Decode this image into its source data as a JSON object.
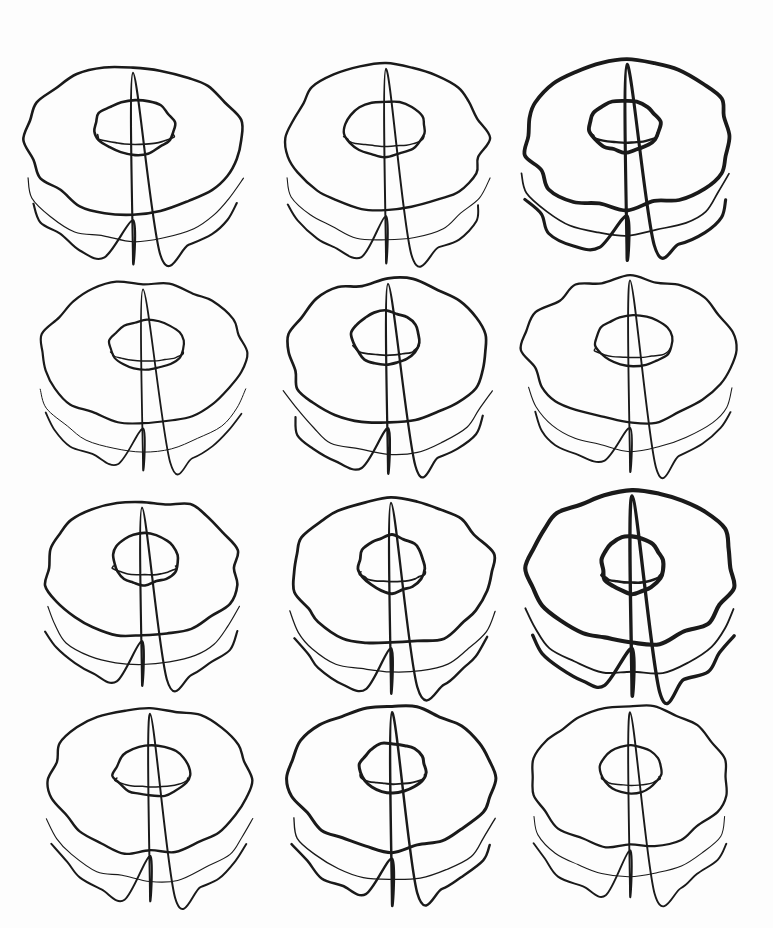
{
  "artwork": {
    "title": "Twelve hand-drawn donuts",
    "description": "Grid of twelve hand-drawn line-art doughnut (torus) shapes in four rows of three, black ink contour on white ground",
    "medium": "ink line drawing",
    "background_color": "#fdfdfd",
    "ink_color": "#1a1a1a",
    "canvas": {
      "width": 773,
      "height": 928
    },
    "grid": {
      "rows": 4,
      "columns": 3,
      "count": 12
    }
  },
  "chart_data": {
    "type": "scatter",
    "xlabel": "",
    "ylabel": "",
    "grid": false,
    "legend": "none",
    "xlim": [
      0,
      773
    ],
    "ylim": [
      0,
      928
    ],
    "columns": [
      "id",
      "row",
      "col",
      "cx",
      "cy",
      "rx",
      "ry",
      "hole_rx",
      "hole_ry",
      "hole_offset_x",
      "hole_offset_y",
      "thickness",
      "stroke_width",
      "wobble"
    ],
    "donuts": [
      {
        "id": "r1c1",
        "row": 1,
        "col": 1,
        "cx": 133,
        "cy": 140,
        "rx": 108,
        "ry": 74,
        "hole_rx": 40,
        "hole_ry": 27,
        "hole_offset_x": 2,
        "hole_offset_y": -13,
        "thickness": 44,
        "stroke_width": 2.6,
        "wobble": 0.055,
        "seed": 11
      },
      {
        "id": "r1c2",
        "row": 1,
        "col": 2,
        "cx": 386,
        "cy": 138,
        "rx": 100,
        "ry": 72,
        "hole_rx": 41,
        "hole_ry": 27,
        "hole_offset_x": -1,
        "hole_offset_y": -9,
        "thickness": 48,
        "stroke_width": 2.4,
        "wobble": 0.06,
        "seed": 23
      },
      {
        "id": "r1c3",
        "row": 1,
        "col": 3,
        "cx": 627,
        "cy": 136,
        "rx": 104,
        "ry": 72,
        "hole_rx": 35,
        "hole_ry": 26,
        "hole_offset_x": -2,
        "hole_offset_y": -10,
        "thickness": 44,
        "stroke_width": 3.8,
        "wobble": 0.07,
        "seed": 37
      },
      {
        "id": "r2c1",
        "row": 2,
        "col": 1,
        "cx": 143,
        "cy": 353,
        "rx": 101,
        "ry": 71,
        "hole_rx": 37,
        "hole_ry": 25,
        "hole_offset_x": 4,
        "hole_offset_y": -8,
        "thickness": 42,
        "stroke_width": 2.2,
        "wobble": 0.05,
        "seed": 41
      },
      {
        "id": "r2c2",
        "row": 2,
        "col": 2,
        "cx": 388,
        "cy": 352,
        "rx": 101,
        "ry": 72,
        "hole_rx": 34,
        "hole_ry": 27,
        "hole_offset_x": -2,
        "hole_offset_y": -14,
        "thickness": 46,
        "stroke_width": 2.7,
        "wobble": 0.055,
        "seed": 53
      },
      {
        "id": "r2c3",
        "row": 2,
        "col": 3,
        "cx": 630,
        "cy": 350,
        "rx": 104,
        "ry": 72,
        "hole_rx": 39,
        "hole_ry": 26,
        "hole_offset_x": 3,
        "hole_offset_y": -9,
        "thickness": 44,
        "stroke_width": 2.3,
        "wobble": 0.058,
        "seed": 67
      },
      {
        "id": "r3c1",
        "row": 3,
        "col": 1,
        "cx": 142,
        "cy": 568,
        "rx": 96,
        "ry": 70,
        "hole_rx": 33,
        "hole_ry": 25,
        "hole_offset_x": 3,
        "hole_offset_y": -9,
        "thickness": 46,
        "stroke_width": 2.6,
        "wobble": 0.062,
        "seed": 71
      },
      {
        "id": "r3c2",
        "row": 3,
        "col": 2,
        "cx": 391,
        "cy": 572,
        "rx": 101,
        "ry": 74,
        "hole_rx": 33,
        "hole_ry": 28,
        "hole_offset_x": 1,
        "hole_offset_y": -8,
        "thickness": 46,
        "stroke_width": 2.8,
        "wobble": 0.06,
        "seed": 83
      },
      {
        "id": "r3c3",
        "row": 3,
        "col": 3,
        "cx": 632,
        "cy": 568,
        "rx": 104,
        "ry": 76,
        "hole_rx": 31,
        "hole_ry": 28,
        "hole_offset_x": 0,
        "hole_offset_y": -3,
        "thickness": 48,
        "stroke_width": 4.1,
        "wobble": 0.058,
        "seed": 97
      },
      {
        "id": "r4c1",
        "row": 4,
        "col": 1,
        "cx": 150,
        "cy": 780,
        "rx": 100,
        "ry": 72,
        "hole_rx": 38,
        "hole_ry": 25,
        "hole_offset_x": 2,
        "hole_offset_y": -9,
        "thickness": 46,
        "stroke_width": 2.4,
        "wobble": 0.06,
        "seed": 103
      },
      {
        "id": "r4c2",
        "row": 4,
        "col": 2,
        "cx": 392,
        "cy": 778,
        "rx": 101,
        "ry": 72,
        "hole_rx": 33,
        "hole_ry": 25,
        "hole_offset_x": 1,
        "hole_offset_y": -10,
        "thickness": 48,
        "stroke_width": 3.0,
        "wobble": 0.048,
        "seed": 113
      },
      {
        "id": "r4c3",
        "row": 4,
        "col": 3,
        "cx": 630,
        "cy": 777,
        "rx": 97,
        "ry": 70,
        "hole_rx": 30,
        "hole_ry": 24,
        "hole_offset_x": 1,
        "hole_offset_y": -7,
        "thickness": 48,
        "stroke_width": 2.3,
        "wobble": 0.05,
        "seed": 127
      }
    ]
  }
}
